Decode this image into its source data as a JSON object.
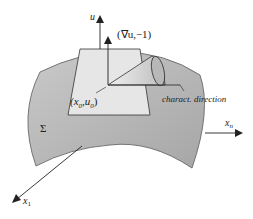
{
  "diagram": {
    "labels": {
      "u_axis": "u",
      "gradient_vector": "(∇u,−1)",
      "point": "(x",
      "point_sub0": "0",
      "point_mid": ",u",
      "point_sub1": "0",
      "point_close": ")",
      "characteristic": "charact. direction",
      "surface": "Σ",
      "xn_axis": "x",
      "xn_sub": "n",
      "x1_axis": "x",
      "x1_sub": "1"
    },
    "colors": {
      "surface_fill": "#b5b5b5",
      "surface_edge": "#5a5a5a",
      "plane_fill": "#e6e6e6",
      "cone_fill": "#d8d8d8",
      "stroke": "#222222"
    }
  }
}
